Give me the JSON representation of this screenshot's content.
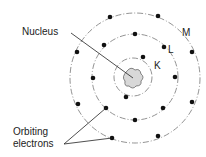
{
  "labels": {
    "nucleus": "Nucleus",
    "shell_m": "M",
    "shell_l": "L",
    "shell_k": "K",
    "orbiting_line1": "Orbiting",
    "orbiting_line2": "electrons"
  },
  "colors": {
    "line": "#222222",
    "nucleus_fill": "#d8d8d8",
    "ring": "#777777"
  }
}
